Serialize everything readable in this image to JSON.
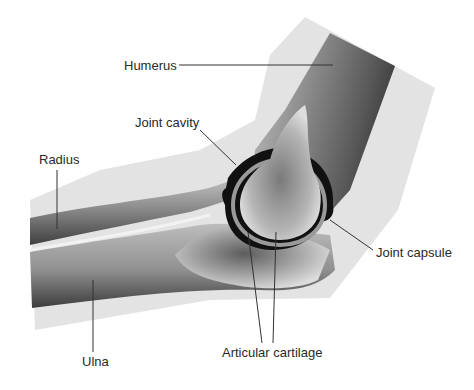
{
  "diagram": {
    "labels": {
      "humerus": "Humerus",
      "joint_cavity": "Joint cavity",
      "radius": "Radius",
      "joint_capsule": "Joint capsule",
      "ulna": "Ulna",
      "articular_cartilage": "Articular cartilage"
    },
    "colors": {
      "background": "#ffffff",
      "soft_tissue": "#e2e2e2",
      "bone_light": "#d0d0d0",
      "bone_dark": "#4a4a4a",
      "cavity": "#111111",
      "leader_line": "#333333",
      "text": "#2a2a2a"
    }
  }
}
